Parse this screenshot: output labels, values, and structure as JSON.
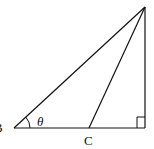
{
  "figure": {
    "type": "geometry-diagram",
    "stroke_color": "#111111",
    "background": "#ffffff",
    "labels": {
      "vertex_b": "B",
      "point_c": "C",
      "angle": "θ"
    },
    "points": {
      "B": [
        14,
        128
      ],
      "C": [
        89,
        128
      ],
      "D": [
        145,
        128
      ],
      "A": [
        145,
        7
      ]
    },
    "right_angle_marker": "at D"
  }
}
